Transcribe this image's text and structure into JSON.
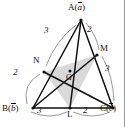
{
  "figure": {
    "background_color": "#ffffff",
    "line_color": "#111111",
    "arc_color": "#8a8a8a",
    "shade_color": "#d8d8d8",
    "vertices": [
      {
        "key": "A",
        "label": "A(",
        "vector": "a",
        "label_close": ")",
        "x": 81,
        "y": 20
      },
      {
        "key": "B",
        "label": "B(",
        "vector": "b",
        "label_close": ")",
        "x": 33,
        "y": 108
      },
      {
        "key": "C",
        "label": "C(",
        "vector": "c",
        "label_close": ")",
        "x": 113,
        "y": 108
      }
    ],
    "points": [
      {
        "key": "L",
        "label": "L",
        "x": 70,
        "y": 108
      },
      {
        "key": "M",
        "label": "M",
        "x": 97,
        "y": 55
      },
      {
        "key": "N",
        "label": "N",
        "x": 44,
        "y": 72
      },
      {
        "key": "G",
        "label": "G",
        "x": 70,
        "y": 73
      }
    ],
    "ratio_labels": [
      {
        "name": "ratio-AN",
        "value": "3",
        "x": 46,
        "y": 31
      },
      {
        "name": "ratio-AM",
        "value": "2",
        "x": 88,
        "y": 28
      },
      {
        "name": "ratio-NB",
        "value": "2",
        "x": 14,
        "y": 70
      },
      {
        "name": "ratio-MC",
        "value": "3",
        "x": 106,
        "y": 66
      },
      {
        "name": "ratio-BL",
        "value": "3",
        "x": 38,
        "y": 106
      },
      {
        "name": "ratio-LC",
        "value": "2",
        "x": 83,
        "y": 106
      }
    ],
    "segments": [
      {
        "name": "side-AB",
        "from": "A",
        "to": "B"
      },
      {
        "name": "side-BC",
        "from": "B",
        "to": "C"
      },
      {
        "name": "side-CA",
        "from": "C",
        "to": "A"
      },
      {
        "name": "cevian-AL",
        "from": "A",
        "to": "L"
      },
      {
        "name": "cevian-BM",
        "from": "B",
        "to": "M"
      },
      {
        "name": "cevian-CN",
        "from": "C",
        "to": "N"
      }
    ],
    "shaded_region": {
      "name": "triangle-LMN",
      "points": [
        "L",
        "M",
        "N"
      ]
    }
  }
}
